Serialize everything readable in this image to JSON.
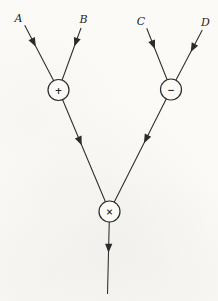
{
  "diagram": {
    "type": "dataflow-graph",
    "canvas": {
      "width": 218,
      "height": 301,
      "paper": "#fbfaf7",
      "ink": "#2b2b2b"
    },
    "arrowhead": {
      "length": 9,
      "half_width": 3.6
    },
    "inputs": [
      {
        "label": "A",
        "x": 18.5,
        "y": 21.5
      },
      {
        "label": "B",
        "x": 83.5,
        "y": 23.0
      },
      {
        "label": "C",
        "x": 141.0,
        "y": 25.3
      },
      {
        "label": "D",
        "x": 205.5,
        "y": 26.3
      }
    ],
    "operators": [
      {
        "id": "plus",
        "symbol": "+",
        "x": 58.5,
        "y": 90.0,
        "r": 10.5
      },
      {
        "id": "minus",
        "symbol": "−",
        "x": 171.0,
        "y": 89.5,
        "r": 10.5
      },
      {
        "id": "times",
        "symbol": "×",
        "x": 109.5,
        "y": 211.5,
        "r": 10.5
      }
    ],
    "edges": [
      {
        "name": "edge-a-to-plus",
        "from": [
          24.7,
          25.3
        ],
        "to": "plus",
        "arrow_t": 0.33
      },
      {
        "name": "edge-b-to-plus",
        "from": [
          81.0,
          28.0
        ],
        "to": "plus",
        "arrow_t": 0.3
      },
      {
        "name": "edge-c-to-minus",
        "from": [
          146.7,
          28.3
        ],
        "to": "minus",
        "arrow_t": 0.34
      },
      {
        "name": "edge-d-to-minus",
        "from": [
          202.3,
          30.0
        ],
        "to": "minus",
        "arrow_t": 0.37
      },
      {
        "name": "edge-plus-to-times",
        "from": "plus",
        "to": "times",
        "arrow_t": 0.455
      },
      {
        "name": "edge-minus-to-times",
        "from": "minus",
        "to": "times",
        "arrow_t": 0.44
      },
      {
        "name": "edge-times-to-output",
        "from": "times",
        "to": [
          107.5,
          294.0
        ],
        "arrow_t": 0.5
      }
    ]
  }
}
